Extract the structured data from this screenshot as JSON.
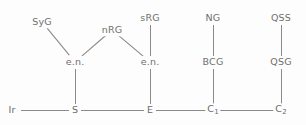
{
  "diagram": {
    "type": "tree",
    "colors": {
      "background": "#fdfdfd",
      "edge": "#8a8a8a",
      "label": "#6f6f6f"
    },
    "nodes": [
      {
        "id": "syg",
        "label": "SyG",
        "sub": "",
        "x": 42,
        "y": 22,
        "row": "top"
      },
      {
        "id": "nrg",
        "label": "nRG",
        "sub": "",
        "x": 112,
        "y": 30,
        "row": "top"
      },
      {
        "id": "srg",
        "label": "sRG",
        "sub": "",
        "x": 150,
        "y": 18,
        "row": "top"
      },
      {
        "id": "ng",
        "label": "NG",
        "sub": "",
        "x": 213,
        "y": 18,
        "row": "top"
      },
      {
        "id": "qss",
        "label": "QSS",
        "sub": "",
        "x": 281,
        "y": 18,
        "row": "top"
      },
      {
        "id": "en1",
        "label": "e.n.",
        "sub": "",
        "x": 75,
        "y": 62,
        "row": "middle"
      },
      {
        "id": "en2",
        "label": "e.n.",
        "sub": "",
        "x": 150,
        "y": 62,
        "row": "middle"
      },
      {
        "id": "bcg",
        "label": "BCG",
        "sub": "",
        "x": 213,
        "y": 62,
        "row": "middle"
      },
      {
        "id": "qsg",
        "label": "QSG",
        "sub": "",
        "x": 281,
        "y": 62,
        "row": "middle"
      },
      {
        "id": "ir",
        "label": "Ir",
        "sub": "",
        "x": 12,
        "y": 110,
        "row": "bottom"
      },
      {
        "id": "s",
        "label": "S",
        "sub": "",
        "x": 75,
        "y": 110,
        "row": "bottom"
      },
      {
        "id": "e",
        "label": "E",
        "sub": "",
        "x": 150,
        "y": 110,
        "row": "bottom"
      },
      {
        "id": "c1",
        "label": "C",
        "sub": "1",
        "x": 213,
        "y": 110,
        "row": "bottom"
      },
      {
        "id": "c2",
        "label": "C",
        "sub": "2",
        "x": 281,
        "y": 110,
        "row": "bottom"
      }
    ],
    "edges": [
      {
        "from": "syg",
        "to": "en1",
        "kind": "diagonal"
      },
      {
        "from": "nrg",
        "to": "en1",
        "kind": "diagonal"
      },
      {
        "from": "nrg",
        "to": "en2",
        "kind": "diagonal"
      },
      {
        "from": "srg",
        "to": "en2",
        "kind": "vertical"
      },
      {
        "from": "en1",
        "to": "s",
        "kind": "vertical"
      },
      {
        "from": "en2",
        "to": "e",
        "kind": "vertical"
      },
      {
        "from": "ng",
        "to": "bcg",
        "kind": "vertical"
      },
      {
        "from": "bcg",
        "to": "c1",
        "kind": "vertical"
      },
      {
        "from": "qss",
        "to": "qsg",
        "kind": "vertical"
      },
      {
        "from": "qsg",
        "to": "c2",
        "kind": "vertical"
      },
      {
        "from": "ir",
        "to": "s",
        "kind": "horizontal"
      },
      {
        "from": "s",
        "to": "e",
        "kind": "horizontal"
      },
      {
        "from": "e",
        "to": "c1",
        "kind": "horizontal"
      },
      {
        "from": "c1",
        "to": "c2",
        "kind": "horizontal"
      }
    ]
  }
}
